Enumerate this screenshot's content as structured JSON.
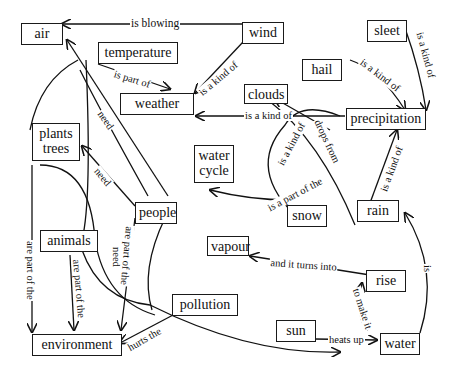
{
  "nodes": {
    "air": "air",
    "temperature": "temperature",
    "wind": "wind",
    "sleet": "sleet",
    "weather": "weather",
    "hail": "hail",
    "clouds": "clouds",
    "precipitation": "precipitation",
    "plants_trees_line1": "plants",
    "plants_trees_line2": "trees",
    "water_cycle_line1": "water",
    "water_cycle_line2": "cycle",
    "people": "people",
    "snow": "snow",
    "rain": "rain",
    "animals": "animals",
    "vapour": "vapour",
    "rise": "rise",
    "pollution": "pollution",
    "sun": "sun",
    "environment": "environment",
    "water": "water"
  },
  "links": {
    "wind_air": "is blowing",
    "temperature_weather": "is part of",
    "wind_weather": "is a kind of",
    "sleet_precip": "is a kind of",
    "hail_precip": "is a kind of",
    "precip_weather": "is a kind of",
    "people_air": "need",
    "people_plants": "need",
    "snow_precip": "is a kind of",
    "clouds_drops": "drops from",
    "snow_watercycle": "is a part of the",
    "rain_precip": "is a kind of",
    "plants_env": "are part of the",
    "animals_env": "are part of the",
    "animals_need": "need",
    "people_env": "are part of the",
    "rise_vapour": "and it turns into",
    "water_rise": "to make it",
    "water_rain": "is",
    "pollution_env": "hurts the",
    "sun_water": "heats up"
  }
}
